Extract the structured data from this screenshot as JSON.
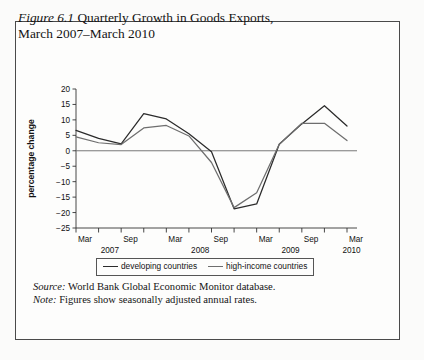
{
  "figure": {
    "label": "Figure 6.1",
    "title": "Quarterly Growth in Goods Exports,",
    "title_line2": "March 2007–March 2010"
  },
  "footnotes": {
    "source_label": "Source:",
    "source_text": " World Bank Global Economic Monitor database.",
    "note_label": "Note:",
    "note_text": " Figures show seasonally adjusted annual rates."
  },
  "colors": {
    "developing": "#2b2b2b",
    "high_income": "#6e6e6e",
    "axis": "#333333",
    "zero_line": "#6a6a6a",
    "border": "#4a4a4a"
  },
  "chart_data": {
    "type": "line",
    "title": "Quarterly Growth in Goods Exports, March 2007–March 2010",
    "xlabel": "month/year",
    "ylabel": "percentage change",
    "ylim": [
      -25,
      20
    ],
    "yticks": [
      20,
      15,
      10,
      5,
      0,
      -5,
      -10,
      -15,
      -20,
      -25
    ],
    "ytick_labels": [
      "20",
      "15",
      "10",
      "5",
      "0",
      "−5",
      "−10",
      "−15",
      "−20",
      "−25"
    ],
    "grid": false,
    "legend_position": "below",
    "x": [
      "Mar 2007",
      "Jun 2007",
      "Sep 2007",
      "Dec 2007",
      "Mar 2008",
      "Jun 2008",
      "Sep 2008",
      "Dec 2008",
      "Mar 2009",
      "Jun 2009",
      "Sep 2009",
      "Dec 2009",
      "Mar 2010"
    ],
    "xtick_labels": [
      "Mar",
      "",
      "Sep",
      "",
      "Mar",
      "",
      "Sep",
      "",
      "Mar",
      "",
      "Sep",
      "",
      "Mar"
    ],
    "year_labels": [
      {
        "text": "2007",
        "index": 1.5
      },
      {
        "text": "2008",
        "index": 5.5
      },
      {
        "text": "2009",
        "index": 9.5
      },
      {
        "text": "2010",
        "index": 12.2
      }
    ],
    "series": [
      {
        "name": "developing countries",
        "color": "#2b2b2b",
        "values": [
          6.6,
          4.0,
          2.2,
          12.0,
          10.3,
          5.5,
          -0.3,
          -18.8,
          -17.2,
          2.1,
          8.7,
          14.6,
          8.0
        ]
      },
      {
        "name": "high-income countries",
        "color": "#6e6e6e",
        "values": [
          4.5,
          2.6,
          2.0,
          7.4,
          8.2,
          4.8,
          -3.8,
          -18.4,
          -13.6,
          2.1,
          8.9,
          8.9,
          3.3
        ]
      }
    ]
  }
}
